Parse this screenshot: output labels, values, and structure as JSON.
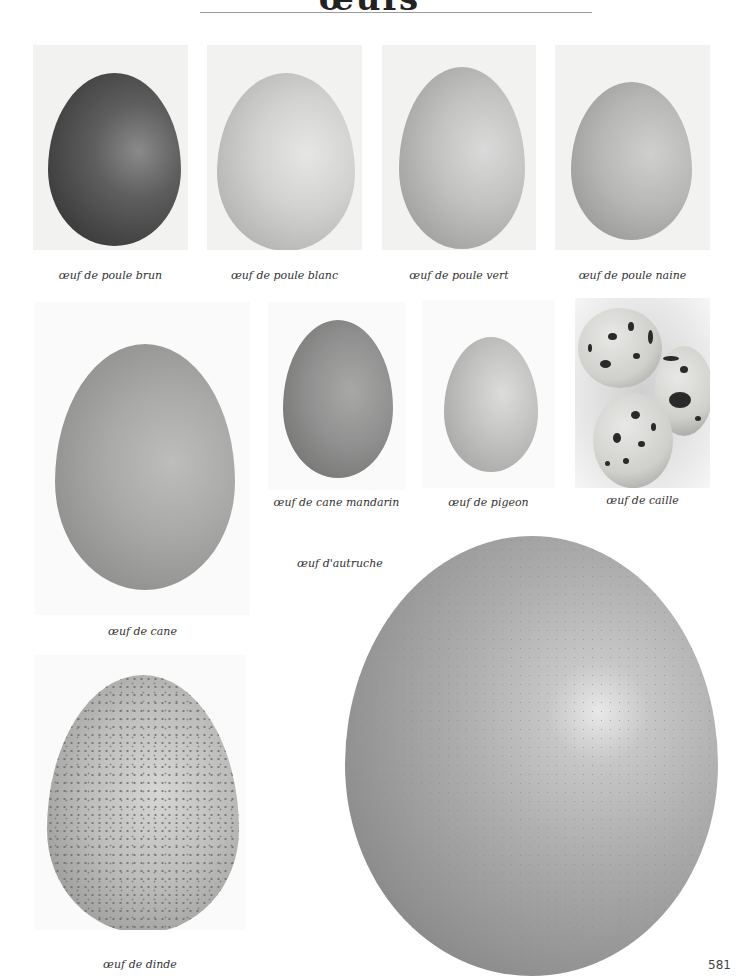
{
  "page": {
    "title_fragment": "œufs",
    "page_number": "581"
  },
  "eggs": [
    {
      "id": "brown-hen",
      "caption": "œuf de poule brun"
    },
    {
      "id": "white-hen",
      "caption": "œuf de poule blanc"
    },
    {
      "id": "green-hen",
      "caption": "œuf de poule vert"
    },
    {
      "id": "bantam-hen",
      "caption": "œuf de poule naine"
    },
    {
      "id": "duck",
      "caption": "œuf de cane"
    },
    {
      "id": "mandarin-duck",
      "caption": "œuf de cane mandarin"
    },
    {
      "id": "pigeon",
      "caption": "œuf de pigeon"
    },
    {
      "id": "quail",
      "caption": "œuf de caille"
    },
    {
      "id": "ostrich",
      "caption": "œuf d'autruche"
    },
    {
      "id": "turkey",
      "caption": "œuf de dinde"
    }
  ]
}
